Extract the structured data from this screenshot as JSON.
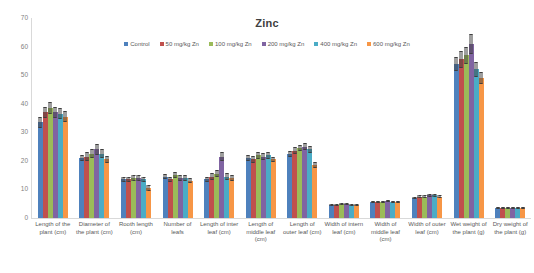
{
  "chart_data": {
    "type": "bar",
    "title": "Zinc",
    "xlabel": "",
    "ylabel": "",
    "ylim": [
      0,
      70
    ],
    "ytick_step": 10,
    "yticks": [
      0,
      10,
      20,
      30,
      40,
      50,
      60,
      70
    ],
    "grid": false,
    "legend_position": "top",
    "error_bars": true,
    "categories": [
      "Length of the plant (cm)",
      "Diameter of the plant (cm)",
      "Rooth length (cm)",
      "Number of leafs",
      "Length of inter leaf (cm)",
      "Length of middle leaf (cm)",
      "Length of outer leaf (cm)",
      "Width of intern leaf (cm)",
      "Width of middle leaf (cm)",
      "Width of outer leaf (cm)",
      "Wet weight of the plant (g)",
      "Dry weight of the plant (g)"
    ],
    "series": [
      {
        "name": "Control",
        "color": "#4E81BD",
        "values": [
          33.5,
          21.0,
          13.5,
          14.5,
          13.5,
          21.0,
          22.5,
          4.5,
          5.5,
          7.0,
          54.0,
          3.5
        ],
        "errors": [
          2.0,
          1.2,
          0.9,
          0.9,
          1.0,
          1.0,
          1.0,
          0.4,
          0.4,
          0.5,
          2.5,
          0.3
        ]
      },
      {
        "name": "50 mg/kg Zn",
        "color": "#C0504D",
        "values": [
          37.0,
          21.5,
          13.5,
          13.5,
          14.5,
          20.5,
          23.5,
          4.5,
          5.5,
          7.5,
          55.5,
          3.5
        ],
        "errors": [
          2.0,
          1.5,
          0.9,
          1.0,
          1.2,
          1.2,
          1.2,
          0.4,
          0.4,
          0.5,
          3.0,
          0.3
        ]
      },
      {
        "name": "100 mg/kg Zn",
        "color": "#9BBB59",
        "values": [
          38.5,
          22.5,
          14.0,
          15.0,
          15.5,
          22.0,
          24.5,
          5.0,
          5.5,
          7.5,
          57.0,
          3.5
        ],
        "errors": [
          2.0,
          1.5,
          1.0,
          1.0,
          1.2,
          1.2,
          1.2,
          0.4,
          0.4,
          0.5,
          3.0,
          0.3
        ]
      },
      {
        "name": "200 mg/kg Zn",
        "color": "#8064A2",
        "values": [
          37.0,
          24.0,
          14.0,
          14.0,
          21.5,
          21.5,
          25.0,
          5.0,
          6.0,
          8.0,
          61.0,
          3.5
        ],
        "errors": [
          2.0,
          1.8,
          1.0,
          1.0,
          1.5,
          1.2,
          1.2,
          0.4,
          0.4,
          0.5,
          3.5,
          0.3
        ]
      },
      {
        "name": "400 mg/kg Zn",
        "color": "#4BACC6",
        "values": [
          36.5,
          22.5,
          13.5,
          14.0,
          14.5,
          22.0,
          24.0,
          4.5,
          5.5,
          8.0,
          52.0,
          3.5
        ],
        "errors": [
          2.0,
          1.5,
          0.9,
          1.0,
          1.2,
          1.2,
          1.2,
          0.4,
          0.4,
          0.5,
          2.5,
          0.3
        ]
      },
      {
        "name": "600 mg/kg Zn",
        "color": "#F79646",
        "values": [
          35.5,
          20.5,
          10.5,
          13.0,
          14.0,
          20.5,
          18.5,
          4.5,
          5.5,
          7.5,
          49.0,
          3.5
        ],
        "errors": [
          2.0,
          1.2,
          0.9,
          0.9,
          1.0,
          1.0,
          1.0,
          0.4,
          0.4,
          0.5,
          2.0,
          0.3
        ]
      }
    ]
  }
}
